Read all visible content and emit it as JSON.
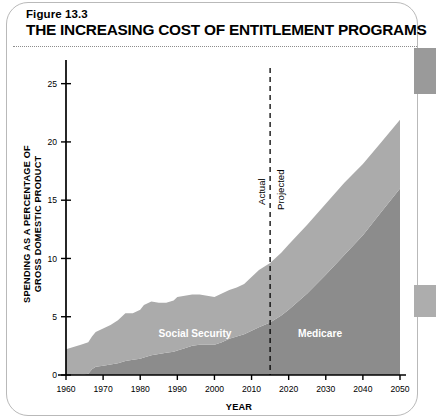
{
  "figure": {
    "number": "Figure 13.3",
    "title": "THE INCREASING COST OF ENTITLEMENT PROGRAMS"
  },
  "chart_data": {
    "type": "area",
    "title": "THE INCREASING COST OF ENTITLEMENT PROGRAMS",
    "xlabel": "YEAR",
    "ylabel": "SPENDING AS A PERCENTAGE OF GROSS DOMESTIC PRODUCT",
    "stacked": true,
    "grid": false,
    "legend_position": "inline",
    "xlim": [
      1960,
      2050
    ],
    "ylim": [
      0,
      26
    ],
    "xticks": [
      1960,
      1970,
      1980,
      1990,
      2000,
      2010,
      2020,
      2030,
      2040,
      2050
    ],
    "yticks": [
      0,
      5,
      10,
      15,
      20,
      25
    ],
    "x": [
      1960,
      1962,
      1964,
      1966,
      1967,
      1968,
      1970,
      1972,
      1974,
      1976,
      1978,
      1980,
      1981,
      1983,
      1985,
      1987,
      1989,
      1990,
      1992,
      1994,
      1996,
      1998,
      2000,
      2002,
      2004,
      2006,
      2008,
      2010,
      2012,
      2015,
      2018,
      2020,
      2025,
      2030,
      2035,
      2040,
      2045,
      2050
    ],
    "series": [
      {
        "name": "Medicare",
        "color": "#8c8c8c",
        "values": [
          0,
          0,
          0,
          0.1,
          0.5,
          0.7,
          0.8,
          0.9,
          1.0,
          1.2,
          1.3,
          1.4,
          1.5,
          1.7,
          1.8,
          1.9,
          2.0,
          2.1,
          2.3,
          2.5,
          2.6,
          2.6,
          2.6,
          2.8,
          3.1,
          3.3,
          3.5,
          3.8,
          4.1,
          4.5,
          5.1,
          5.6,
          7.0,
          8.6,
          10.3,
          12.0,
          14.0,
          16.0
        ]
      },
      {
        "name": "Social Security",
        "color": "#ababab",
        "values": [
          2.2,
          2.4,
          2.6,
          2.7,
          2.8,
          3.0,
          3.2,
          3.4,
          3.7,
          4.1,
          4.0,
          4.2,
          4.5,
          4.6,
          4.4,
          4.3,
          4.4,
          4.6,
          4.5,
          4.4,
          4.3,
          4.2,
          4.1,
          4.2,
          4.2,
          4.2,
          4.3,
          4.6,
          4.9,
          5.1,
          5.4,
          5.6,
          5.9,
          6.1,
          6.2,
          6.1,
          6.0,
          5.9
        ]
      }
    ],
    "annotations": [
      {
        "name": "divider",
        "x": 2015,
        "left_label": "Actual",
        "right_label": "Projected"
      }
    ]
  }
}
